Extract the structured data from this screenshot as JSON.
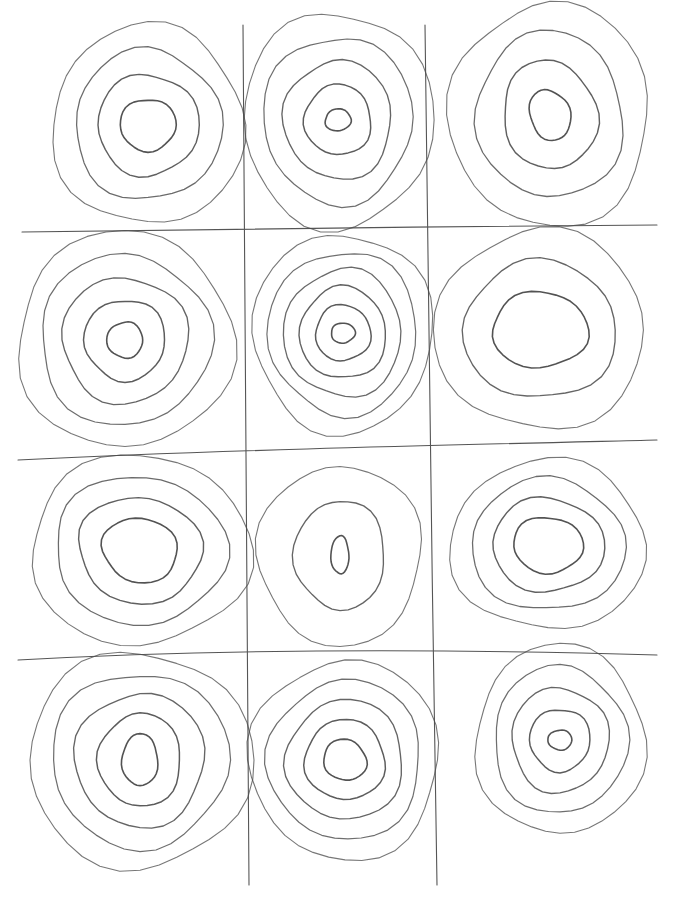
{
  "artwork": {
    "title": "Concentric circles pencil sketch",
    "medium": "pencil on paper",
    "colors": {
      "paper": "#ffffff",
      "pencil": "#4a4a4a"
    },
    "grid": {
      "columns": 3,
      "rows": 4
    },
    "cells": [
      {
        "row": 1,
        "col": 1,
        "rings": 4,
        "center_shape": "rounded blob"
      },
      {
        "row": 1,
        "col": 2,
        "rings": 5,
        "center_shape": "small oval"
      },
      {
        "row": 1,
        "col": 3,
        "rings": 4,
        "center_shape": "tilted oval"
      },
      {
        "row": 2,
        "col": 1,
        "rings": 5,
        "center_shape": "rounded square"
      },
      {
        "row": 2,
        "col": 2,
        "rings": 6,
        "center_shape": "small oval"
      },
      {
        "row": 2,
        "col": 3,
        "rings": 3,
        "center_shape": "large oval"
      },
      {
        "row": 3,
        "col": 1,
        "rings": 4,
        "center_shape": "oval"
      },
      {
        "row": 3,
        "col": 2,
        "rings": 3,
        "center_shape": "narrow vertical oval"
      },
      {
        "row": 3,
        "col": 3,
        "rings": 4,
        "center_shape": "oval"
      },
      {
        "row": 4,
        "col": 1,
        "rings": 5,
        "center_shape": "vertical oval"
      },
      {
        "row": 4,
        "col": 2,
        "rings": 5,
        "center_shape": "tilted oval"
      },
      {
        "row": 4,
        "col": 3,
        "rings": 5,
        "center_shape": "small circle"
      }
    ]
  }
}
